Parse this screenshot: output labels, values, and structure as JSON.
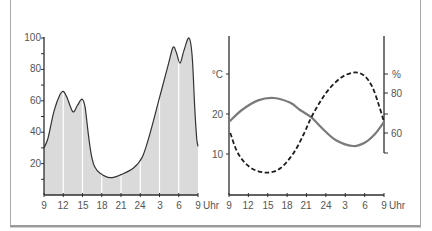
{
  "colors": {
    "area_fill": "#dadada",
    "area_line": "#333333",
    "grid_white": "#ffffff",
    "axis": "#2e2e2e",
    "solid_line": "#7a7a7a",
    "dashed_line": "#1e1e1e",
    "label": "#555555"
  },
  "chart_data": [
    {
      "type": "area",
      "title": "",
      "xlabel": "Uhr",
      "ylabel": "",
      "x_unit_note": "hours after 9 Uhr",
      "x_tick_labels": [
        "9",
        "12",
        "15",
        "18",
        "21",
        "24",
        "3",
        "6",
        "9"
      ],
      "x_tick_positions": [
        0,
        3,
        6,
        9,
        12,
        15,
        18,
        21,
        24
      ],
      "y_tick_labels": [
        "20",
        "40",
        "60",
        "80",
        "100"
      ],
      "y_tick_values": [
        20,
        40,
        60,
        80,
        100
      ],
      "y_minor_ticks": [
        10,
        30,
        50,
        70,
        90
      ],
      "ylim": [
        0,
        100
      ],
      "grid": "white vertical lines at x ticks inside filled area",
      "points": [
        [
          0,
          30
        ],
        [
          0.6,
          36
        ],
        [
          1.6,
          54
        ],
        [
          2.5,
          64
        ],
        [
          3.0,
          66
        ],
        [
          3.6,
          62
        ],
        [
          4.5,
          53
        ],
        [
          5.2,
          57
        ],
        [
          5.9,
          61
        ],
        [
          6.4,
          56
        ],
        [
          6.9,
          39
        ],
        [
          7.4,
          25
        ],
        [
          7.9,
          18
        ],
        [
          8.7,
          14
        ],
        [
          10.3,
          11
        ],
        [
          12.0,
          13
        ],
        [
          13.9,
          17
        ],
        [
          15.3,
          24
        ],
        [
          16.5,
          39
        ],
        [
          18.0,
          62
        ],
        [
          19.3,
          82
        ],
        [
          20.1,
          94
        ],
        [
          20.6,
          91
        ],
        [
          21.2,
          84
        ],
        [
          21.8,
          92
        ],
        [
          22.6,
          100
        ],
        [
          23.1,
          88
        ],
        [
          23.5,
          55
        ],
        [
          23.8,
          36
        ],
        [
          24,
          31
        ]
      ]
    },
    {
      "type": "line",
      "title": "",
      "xlabel": "Uhr",
      "x_unit_note": "hours after 9 Uhr",
      "x_tick_labels": [
        "9",
        "12",
        "15",
        "18",
        "21",
        "24",
        "3",
        "6",
        "9"
      ],
      "x_tick_positions": [
        0,
        3,
        6,
        9,
        12,
        15,
        18,
        21,
        24
      ],
      "y_left": {
        "label": "°C",
        "tick_labels": [
          "20",
          "10"
        ],
        "tick_values": [
          20,
          10
        ],
        "label_value": 30,
        "ylim": [
          0,
          40
        ]
      },
      "y_right": {
        "label": "%",
        "tick_labels": [
          "80",
          "60"
        ],
        "tick_values": [
          80,
          60
        ],
        "minor_ticks": [
          70
        ],
        "label_value": 90,
        "ylim": [
          50,
          110
        ]
      },
      "series": [
        {
          "name": "°C (solid)",
          "axis": "left",
          "style": "solid",
          "points": [
            [
              0,
              18
            ],
            [
              2,
              21
            ],
            [
              4.5,
              23.4
            ],
            [
              7,
              24
            ],
            [
              9.5,
              22.8
            ],
            [
              11,
              21
            ],
            [
              12.7,
              19.2
            ],
            [
              14.5,
              16.3
            ],
            [
              16.5,
              13.5
            ],
            [
              19.2,
              12
            ],
            [
              21,
              12.8
            ],
            [
              22.6,
              15
            ],
            [
              24,
              18
            ]
          ]
        },
        {
          "name": "% (dashed)",
          "axis": "right",
          "style": "dashed",
          "points": [
            [
              0.2,
              60
            ],
            [
              1.2,
              51
            ],
            [
              2.5,
              45
            ],
            [
              4,
              41.5
            ],
            [
              6,
              40.2
            ],
            [
              8,
              42.5
            ],
            [
              10,
              50
            ],
            [
              11.5,
              59
            ],
            [
              12.7,
              67.5
            ],
            [
              14,
              75
            ],
            [
              15.5,
              82
            ],
            [
              17.5,
              88
            ],
            [
              19.5,
              90.3
            ],
            [
              21,
              88.5
            ],
            [
              22.2,
              83
            ],
            [
              23.2,
              74
            ],
            [
              24,
              65.5
            ]
          ]
        }
      ]
    }
  ]
}
